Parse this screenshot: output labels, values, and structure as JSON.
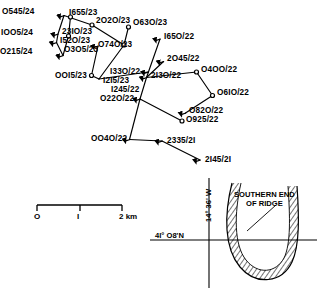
{
  "figure": {
    "type": "ship-track-map",
    "stroke_color": "#000000"
  },
  "stations": [
    {
      "id": "s1",
      "label": "O545/24",
      "node_x": 70.5,
      "node_y": 17.0,
      "marker": "circle",
      "label_x": 2,
      "label_y": 8
    },
    {
      "id": "s2",
      "label": "IOO5/24",
      "node_x": 68.5,
      "node_y": 36.0,
      "marker": "circle",
      "label_x": 1,
      "label_y": 29
    },
    {
      "id": "s3",
      "label": "O215/24",
      "node_x": 63.0,
      "node_y": 55.5,
      "marker": "arrow",
      "label_x": 0,
      "label_y": 48
    },
    {
      "id": "s4",
      "label": "I655/23",
      "node_x": 64.0,
      "node_y": 15.5,
      "marker": "arrow",
      "label_x": 69,
      "label_y": 9
    },
    {
      "id": "s5",
      "label": "2O2O/23",
      "node_x": 92.0,
      "node_y": 25.0,
      "marker": "circle",
      "label_x": 96,
      "label_y": 17
    },
    {
      "id": "s6",
      "label": "O63O/23",
      "node_x": 128.5,
      "node_y": 27.0,
      "marker": "circle",
      "label_x": 133,
      "label_y": 19
    },
    {
      "id": "s7",
      "label": "23IO/23",
      "node_x": 58.0,
      "node_y": 34.0,
      "marker": "arrow",
      "label_x": 62,
      "label_y": 28
    },
    {
      "id": "s8",
      "label": "I52O/23",
      "node_x": 56.5,
      "node_y": 42.5,
      "marker": "arrow",
      "label_x": 60,
      "label_y": 37
    },
    {
      "id": "s9",
      "label": "O3O5/23",
      "node_x": 98.0,
      "node_y": 46.0,
      "marker": "arrow",
      "label_x": 64,
      "label_y": 46
    },
    {
      "id": "s10",
      "label": "O74O/23",
      "node_x": 124.0,
      "node_y": 45.0,
      "marker": "circle",
      "label_x": 98,
      "label_y": 41
    },
    {
      "id": "s11",
      "label": "I65O/22",
      "node_x": 160.0,
      "node_y": 39.0,
      "marker": "arrow",
      "label_x": 164,
      "label_y": 33
    },
    {
      "id": "s12",
      "label": "2O45/22",
      "node_x": 163.5,
      "node_y": 61.5,
      "marker": "arrow",
      "label_x": 167,
      "label_y": 55
    },
    {
      "id": "s13",
      "label": "OOI5/23",
      "node_x": 91.5,
      "node_y": 75.5,
      "marker": "circle",
      "label_x": 55,
      "label_y": 72
    },
    {
      "id": "s14",
      "label": "I33O/22",
      "node_x": 148.0,
      "node_y": 72.0,
      "marker": "arrow",
      "label_x": 110,
      "label_y": 68
    },
    {
      "id": "s15",
      "label": "I2I5/23",
      "node_x": 99.0,
      "node_y": 79.0,
      "marker": "none",
      "label_x": 103,
      "label_y": 77
    },
    {
      "id": "s16",
      "label": "2I3O/22",
      "node_x": 146.5,
      "node_y": 77.5,
      "marker": "arrow",
      "label_x": 151,
      "label_y": 72
    },
    {
      "id": "s17",
      "label": "I245/22",
      "node_x": 140.0,
      "node_y": 88.0,
      "marker": "none",
      "label_x": 111,
      "label_y": 86
    },
    {
      "id": "s18",
      "label": "O22O/22",
      "node_x": 140.0,
      "node_y": 99.0,
      "marker": "arrow",
      "label_x": 100,
      "label_y": 95
    },
    {
      "id": "s19",
      "label": "O4OO/22",
      "node_x": 196.5,
      "node_y": 72.0,
      "marker": "circle",
      "label_x": 201,
      "label_y": 66
    },
    {
      "id": "s20",
      "label": "O6IO/22",
      "node_x": 212.5,
      "node_y": 95.5,
      "marker": "circle",
      "label_x": 217,
      "label_y": 89
    },
    {
      "id": "s21",
      "label": "O82O/22",
      "node_x": 185.5,
      "node_y": 113.0,
      "marker": "arrow",
      "label_x": 189,
      "label_y": 107
    },
    {
      "id": "s22",
      "label": "O925/22",
      "node_x": 182.0,
      "node_y": 121.0,
      "marker": "circle",
      "label_x": 186,
      "label_y": 116
    },
    {
      "id": "s23",
      "label": "OO4O/22",
      "node_x": 129.5,
      "node_y": 139.5,
      "marker": "arrow",
      "label_x": 91,
      "label_y": 135
    },
    {
      "id": "s24",
      "label": "2335/2I",
      "node_x": 162.0,
      "node_y": 141.0,
      "marker": "arrow",
      "label_x": 167,
      "label_y": 137
    },
    {
      "id": "s25",
      "label": "2I45/2I",
      "node_x": 200.0,
      "node_y": 160.0,
      "marker": "arrow",
      "label_x": 205,
      "label_y": 156
    }
  ],
  "track_segments": [
    {
      "name": "leg-north-loop",
      "points": "70.5,17.0 68.5,36.0 63.0,55.5"
    },
    {
      "name": "leg-1655-2020",
      "points": "64.0,15.5 92.0,25.0"
    },
    {
      "name": "leg-2020-0740",
      "points": "92.0,25.0 124.0,45.0"
    },
    {
      "name": "leg-0630-0740",
      "points": "128.5,27.0 124.0,45.0"
    },
    {
      "name": "leg-1655-2310",
      "points": "64.0,15.5 58.0,34.0 56.5,42.5 63.0,55.5"
    },
    {
      "name": "leg-0305-0015",
      "points": "98.0,46.0 91.5,75.5"
    },
    {
      "name": "leg-0015-1215",
      "points": "91.5,75.5 99.0,79.0"
    },
    {
      "name": "leg-0740-1215",
      "points": "124.0,45.0 99.0,79.0"
    },
    {
      "name": "leg-1215-1330",
      "points": "99.0,79.0 148.0,72.0"
    },
    {
      "name": "leg-1650-2130",
      "points": "160.0,39.0 146.5,77.5"
    },
    {
      "name": "leg-2045-2130",
      "points": "163.5,61.5 146.5,77.5"
    },
    {
      "name": "leg-2130-0220",
      "points": "146.5,77.5 140.0,99.0"
    },
    {
      "name": "leg-2130-0400",
      "points": "146.5,77.5 196.5,72.0"
    },
    {
      "name": "leg-0400-0610",
      "points": "196.5,72.0 212.5,95.5"
    },
    {
      "name": "leg-0610-0820",
      "points": "212.5,95.5 185.5,113.0"
    },
    {
      "name": "leg-0220-0925",
      "points": "140.0,99.0 182.0,121.0"
    },
    {
      "name": "leg-0220-0040",
      "points": "140.0,99.0 129.5,139.5"
    },
    {
      "name": "leg-0040-2335",
      "points": "129.5,139.5 162.0,141.0"
    },
    {
      "name": "leg-2335-2145",
      "points": "162.0,141.0 200.0,160.0"
    }
  ],
  "scale_bar": {
    "name": "distance-scale",
    "ticks": [
      {
        "label": "O",
        "x": 37
      },
      {
        "label": "I",
        "x": 80
      },
      {
        "label": "2 km",
        "x": 122
      }
    ],
    "bar_left": 37,
    "bar_right": 122,
    "bar_y": 205
  },
  "graticule": {
    "longitude_label": "14° 36' W",
    "latitude_label": "4I° O8'N"
  },
  "annotation": {
    "ridge_line1": "SOUTHERN END",
    "ridge_line2": "OF RIDGE"
  }
}
